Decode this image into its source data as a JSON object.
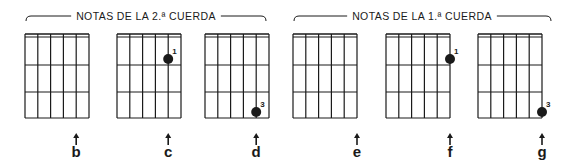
{
  "groups": [
    {
      "label": "NOTAS DE LA 2.ª CUERDA",
      "bracket_x1": 26,
      "bracket_x2": 266,
      "text_x": 146
    },
    {
      "label": "NOTAS DE LA 1.ª CUERDA",
      "bracket_x1": 294,
      "bracket_x2": 551,
      "text_x": 422
    }
  ],
  "diagram_geometry": {
    "strings": 6,
    "frets": 3,
    "width": 64,
    "top": 34,
    "fret_ys": [
      37,
      65,
      92,
      118
    ],
    "arrow_y": 133,
    "note_y": 157
  },
  "diagrams": [
    {
      "note": "b",
      "x": 25,
      "string": 2,
      "fret": 0,
      "finger": ""
    },
    {
      "note": "c",
      "x": 117,
      "string": 2,
      "fret": 1,
      "finger": "1"
    },
    {
      "note": "d",
      "x": 205,
      "string": 2,
      "fret": 3,
      "finger": "3"
    },
    {
      "note": "e",
      "x": 293,
      "string": 1,
      "fret": 0,
      "finger": ""
    },
    {
      "note": "f",
      "x": 386,
      "string": 1,
      "fret": 1,
      "finger": "1"
    },
    {
      "note": "g",
      "x": 478,
      "string": 1,
      "fret": 3,
      "finger": "3"
    }
  ],
  "colors": {
    "ink": "#1a1a1a",
    "background": "#ffffff"
  }
}
